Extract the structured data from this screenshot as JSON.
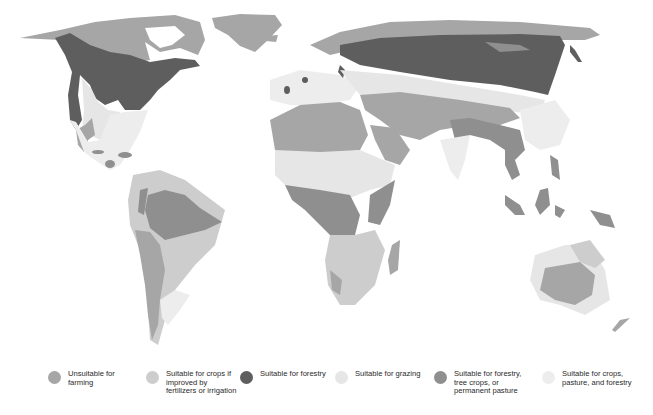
{
  "map": {
    "colors": {
      "unsuitable": "#a6a6a6",
      "crops_if_improved": "#cdcdcd",
      "forestry": "#5e5e5e",
      "grazing": "#e6e6e6",
      "forestry_tree_crops_pasture": "#8f8f8f",
      "crops_pasture_forestry": "#ededed"
    }
  },
  "legend": {
    "items": [
      {
        "key": "unsuitable",
        "label": "Unsuitable for farming",
        "lines": [
          "Unsuitable for",
          "farming"
        ],
        "color": "#a6a6a6",
        "x": 48
      },
      {
        "key": "crops_if_improved",
        "label": "Suitable for crops if improved by fertilizers or irrigation",
        "lines": [
          "Suitable for crops if",
          "improved by",
          "fertilizers or irrigation"
        ],
        "color": "#cdcdcd",
        "x": 146
      },
      {
        "key": "forestry",
        "label": "Suitable for forestry",
        "lines": [
          "Suitable for forestry"
        ],
        "color": "#5e5e5e",
        "x": 240
      },
      {
        "key": "grazing",
        "label": "Suitable for grazing",
        "lines": [
          "Suitable for grazing"
        ],
        "color": "#e6e6e6",
        "x": 335
      },
      {
        "key": "forestry_tree_crops_pasture",
        "label": "Suitable for forestry, tree crops, or permanent pasture",
        "lines": [
          "Suitable for forestry,",
          "tree crops, or",
          "permanent pasture"
        ],
        "color": "#8f8f8f",
        "x": 434
      },
      {
        "key": "crops_pasture_forestry",
        "label": "Suitable for crops, pasture, and forestry",
        "lines": [
          "Suitable for crops,",
          "pasture, and forestry"
        ],
        "color": "#ededed",
        "x": 542
      }
    ]
  }
}
